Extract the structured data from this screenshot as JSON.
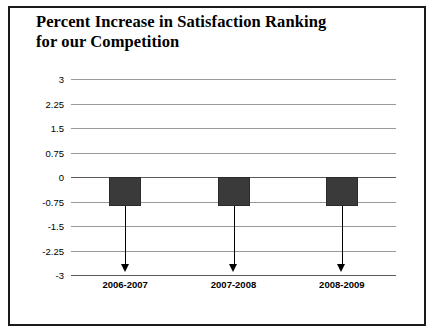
{
  "chart_data": {
    "type": "bar",
    "title": "Percent Increase in Satisfaction Ranking for our Competition",
    "title_line1": "Percent Increase in Satisfaction Ranking",
    "title_line2": "for our Competition",
    "xlabel": "",
    "ylabel": "",
    "categories": [
      "2006-2007",
      "2007-2008",
      "2008-2009"
    ],
    "values": [
      -0.9,
      -0.9,
      -0.9
    ],
    "ylim": [
      -3,
      3
    ],
    "yticks": [
      "3",
      "2.25",
      "1.5",
      "0.75",
      "0",
      "-0.75",
      "-1.5",
      "-2.25",
      "-3"
    ],
    "ytick_values": [
      3,
      2.25,
      1.5,
      0.75,
      0,
      -0.75,
      -1.5,
      -2.25,
      -3
    ],
    "grid": true,
    "legend": "none",
    "bar_color": "#3a3a3a",
    "annotations": [
      {
        "name": "down-arrow",
        "category": "2006-2007",
        "from": -0.9,
        "to": -2.9
      },
      {
        "name": "down-arrow",
        "category": "2007-2008",
        "from": -0.9,
        "to": -2.9
      },
      {
        "name": "down-arrow",
        "category": "2008-2009",
        "from": -0.9,
        "to": -2.9
      }
    ]
  }
}
